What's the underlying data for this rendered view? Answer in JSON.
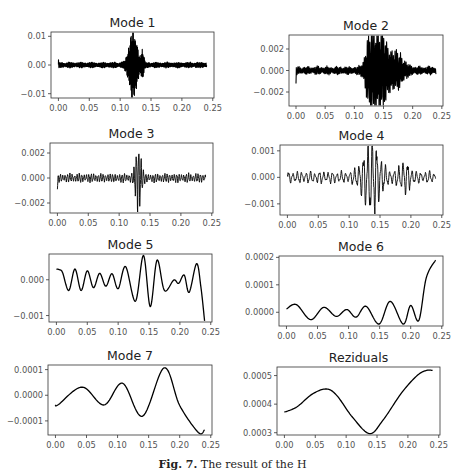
{
  "figure": {
    "caption_label": "Fig. 7.",
    "caption_text": " The result of the H",
    "colors": {
      "line": "#000000",
      "axis": "#333333",
      "tick_text": "#555555",
      "title": "#222222"
    }
  },
  "chart_data": [
    {
      "type": "line",
      "id": "mode1",
      "title": "Mode 1",
      "xlabel": "",
      "ylabel": "",
      "xlim": [
        -0.012,
        0.252
      ],
      "ylim": [
        -0.0115,
        0.0115
      ],
      "xticks": [
        0.0,
        0.05,
        0.1,
        0.15,
        0.2,
        0.25
      ],
      "xtick_labels": [
        "0.00",
        "0.05",
        "0.10",
        "0.15",
        "0.20",
        "0.25"
      ],
      "yticks": [
        0.01,
        0.0,
        -0.01
      ],
      "ytick_labels": [
        "0.01",
        "0.00",
        "−0.01"
      ],
      "grid": false,
      "signal": {
        "x_range": [
          0.0,
          0.24
        ],
        "baseline_amp": 0.0009,
        "freq": 900,
        "bursts": [
          {
            "center": 0.121,
            "width": 0.006,
            "amp": 0.0105,
            "decay": 1.0
          },
          {
            "center": 0.136,
            "width": 0.002,
            "amp": 0.004
          }
        ],
        "start_spike": 0.0018,
        "dense": true
      },
      "box": {
        "left": 51,
        "top": 32,
        "right": 214,
        "bottom": 98
      }
    },
    {
      "type": "line",
      "id": "mode2",
      "title": "Mode 2",
      "xlabel": "",
      "ylabel": "",
      "xlim": [
        -0.012,
        0.252
      ],
      "ylim": [
        -0.0033,
        0.0033
      ],
      "xticks": [
        0.0,
        0.05,
        0.1,
        0.15,
        0.2,
        0.25
      ],
      "xtick_labels": [
        "0.00",
        "0.05",
        "0.10",
        "0.15",
        "0.20",
        "0.25"
      ],
      "yticks": [
        0.002,
        0.0,
        -0.002
      ],
      "ytick_labels": [
        "0.002",
        "0.000",
        "−0.002"
      ],
      "grid": false,
      "signal": {
        "x_range": [
          0.0,
          0.24
        ],
        "baseline_amp": 0.00035,
        "freq": 420,
        "bursts": [
          {
            "center": 0.128,
            "width": 0.007,
            "amp": 0.0031
          },
          {
            "center": 0.146,
            "width": 0.008,
            "amp": 0.0031
          },
          {
            "center": 0.17,
            "width": 0.012,
            "amp": 0.0014
          }
        ],
        "start_value": -0.0012,
        "dense": true
      },
      "box": {
        "left": 289,
        "top": 35,
        "right": 443,
        "bottom": 106
      }
    },
    {
      "type": "line",
      "id": "mode3",
      "title": "Mode 3",
      "xlabel": "",
      "ylabel": "",
      "xlim": [
        -0.012,
        0.252
      ],
      "ylim": [
        -0.0028,
        0.0028
      ],
      "xticks": [
        0.0,
        0.05,
        0.1,
        0.15,
        0.2,
        0.25
      ],
      "xtick_labels": [
        "0.00",
        "0.05",
        "0.10",
        "0.15",
        "0.20",
        "0.25"
      ],
      "yticks": [
        0.002,
        0.0,
        -0.002
      ],
      "ytick_labels": [
        "0.002",
        "0.000",
        "−0.002"
      ],
      "grid": false,
      "signal": {
        "x_range": [
          0.0,
          0.24
        ],
        "baseline_amp": 0.00035,
        "freq": 260,
        "bursts": [
          {
            "center": 0.131,
            "width": 0.004,
            "amp": 0.0026
          }
        ],
        "start_value": -0.0009,
        "dense": false
      },
      "box": {
        "left": 50,
        "top": 143,
        "right": 213,
        "bottom": 213
      }
    },
    {
      "type": "line",
      "id": "mode4",
      "title": "Mode 4",
      "xlabel": "",
      "ylabel": "",
      "xlim": [
        -0.012,
        0.252
      ],
      "ylim": [
        -0.00142,
        0.00122
      ],
      "xticks": [
        0.0,
        0.05,
        0.1,
        0.15,
        0.2,
        0.25
      ],
      "xtick_labels": [
        "0.00",
        "0.05",
        "0.10",
        "0.15",
        "0.20",
        "0.25"
      ],
      "yticks": [
        0.001,
        0.0,
        -0.001
      ],
      "ytick_labels": [
        "0.001",
        "0.000",
        "−0.001"
      ],
      "grid": false,
      "signal": {
        "x_range": [
          0.0,
          0.24
        ],
        "baseline_amp": 0.00022,
        "freq": 140,
        "bursts": [
          {
            "center": 0.136,
            "width": 0.012,
            "amp": 0.00125
          },
          {
            "center": 0.19,
            "width": 0.008,
            "amp": 0.0004
          }
        ],
        "start_value": 0.0001,
        "dense": false
      },
      "box": {
        "left": 280,
        "top": 145,
        "right": 443,
        "bottom": 215
      }
    },
    {
      "type": "line",
      "id": "mode5",
      "title": "Mode 5",
      "xlabel": "",
      "ylabel": "",
      "xlim": [
        -0.012,
        0.252
      ],
      "ylim": [
        -0.00118,
        0.00072
      ],
      "xticks": [
        0.0,
        0.05,
        0.1,
        0.15,
        0.2,
        0.25
      ],
      "xtick_labels": [
        "0.00",
        "0.05",
        "0.10",
        "0.15",
        "0.20",
        "0.25"
      ],
      "yticks": [
        0.0,
        -0.001
      ],
      "ytick_labels": [
        "0.000",
        "−0.001"
      ],
      "grid": false,
      "points": [
        [
          0.0,
          0.0003
        ],
        [
          0.005,
          0.00028
        ],
        [
          0.01,
          0.0002
        ],
        [
          0.02,
          -0.0003
        ],
        [
          0.03,
          0.0003
        ],
        [
          0.04,
          -0.0003
        ],
        [
          0.05,
          0.00025
        ],
        [
          0.06,
          -0.00022
        ],
        [
          0.07,
          0.00018
        ],
        [
          0.08,
          -0.00018
        ],
        [
          0.09,
          0.00017
        ],
        [
          0.1,
          -0.00025
        ],
        [
          0.112,
          0.00037
        ],
        [
          0.128,
          -0.0006
        ],
        [
          0.141,
          0.00068
        ],
        [
          0.152,
          -0.00075
        ],
        [
          0.163,
          0.00055
        ],
        [
          0.175,
          -0.0003
        ],
        [
          0.19,
          -1e-05
        ],
        [
          0.198,
          -0.0001
        ],
        [
          0.207,
          0.00013
        ],
        [
          0.215,
          -0.00035
        ],
        [
          0.227,
          0.00045
        ],
        [
          0.234,
          -0.0002
        ],
        [
          0.24,
          -0.00115
        ]
      ],
      "box": {
        "left": 49,
        "top": 254,
        "right": 212,
        "bottom": 322
      }
    },
    {
      "type": "line",
      "id": "mode6",
      "title": "Mode 6",
      "xlabel": "",
      "ylabel": "",
      "xlim": [
        -0.012,
        0.252
      ],
      "ylim": [
        -5e-05,
        0.000205
      ],
      "xticks": [
        0.0,
        0.05,
        0.1,
        0.15,
        0.2,
        0.25
      ],
      "xtick_labels": [
        "0.00",
        "0.05",
        "0.10",
        "0.15",
        "0.20",
        "0.25"
      ],
      "yticks": [
        0.0002,
        0.0001,
        0.0
      ],
      "ytick_labels": [
        "0.0002",
        "0.0001",
        "0.0000"
      ],
      "grid": false,
      "points": [
        [
          0.0,
          1.2e-05
        ],
        [
          0.016,
          2.8e-05
        ],
        [
          0.039,
          -2.7e-05
        ],
        [
          0.06,
          1.8e-05
        ],
        [
          0.08,
          -1.5e-05
        ],
        [
          0.097,
          1e-05
        ],
        [
          0.112,
          -1.8e-05
        ],
        [
          0.128,
          2.2e-05
        ],
        [
          0.149,
          -4.3e-05
        ],
        [
          0.167,
          4e-05
        ],
        [
          0.188,
          -4.3e-05
        ],
        [
          0.2,
          2.5e-05
        ],
        [
          0.213,
          -3e-05
        ],
        [
          0.225,
          0.000125
        ],
        [
          0.24,
          0.00019
        ]
      ],
      "box": {
        "left": 279,
        "top": 256,
        "right": 443,
        "bottom": 326
      }
    },
    {
      "type": "line",
      "id": "mode7",
      "title": "Mode 7",
      "xlabel": "",
      "ylabel": "",
      "xlim": [
        -0.012,
        0.252
      ],
      "ylim": [
        -0.000155,
        0.000118
      ],
      "xticks": [
        0.0,
        0.05,
        0.1,
        0.15,
        0.2,
        0.25
      ],
      "xtick_labels": [
        "0.00",
        "0.05",
        "0.10",
        "0.15",
        "0.20",
        "0.25"
      ],
      "yticks": [
        0.0001,
        0.0,
        -0.0001
      ],
      "ytick_labels": [
        "0.0001",
        "0.0000",
        "−0.0001"
      ],
      "grid": false,
      "points": [
        [
          0.0,
          -3.8e-05
        ],
        [
          0.005,
          -3.6e-05
        ],
        [
          0.043,
          3.2e-05
        ],
        [
          0.078,
          -3.8e-05
        ],
        [
          0.108,
          4.7e-05
        ],
        [
          0.14,
          -8.2e-05
        ],
        [
          0.175,
          0.000107
        ],
        [
          0.2,
          -4e-05
        ],
        [
          0.23,
          -0.000145
        ],
        [
          0.24,
          -0.000135
        ]
      ],
      "box": {
        "left": 48,
        "top": 365,
        "right": 212,
        "bottom": 435
      }
    },
    {
      "type": "line",
      "id": "reziduals",
      "title": "Reziduals",
      "xlabel": "",
      "ylabel": "",
      "xlim": [
        -0.012,
        0.252
      ],
      "ylim": [
        0.000292,
        0.00053
      ],
      "xticks": [
        0.0,
        0.05,
        0.1,
        0.15,
        0.2,
        0.25
      ],
      "xtick_labels": [
        "0.00",
        "0.05",
        "0.10",
        "0.15",
        "0.20",
        "0.25"
      ],
      "yticks": [
        0.0005,
        0.0004,
        0.0003
      ],
      "ytick_labels": [
        "0.0005",
        "0.0004",
        "0.0003"
      ],
      "grid": false,
      "points": [
        [
          0.0,
          0.000372
        ],
        [
          0.02,
          0.00039
        ],
        [
          0.045,
          0.000435
        ],
        [
          0.068,
          0.000453
        ],
        [
          0.085,
          0.00043
        ],
        [
          0.11,
          0.000355
        ],
        [
          0.138,
          0.000297
        ],
        [
          0.16,
          0.000345
        ],
        [
          0.19,
          0.00044
        ],
        [
          0.215,
          0.0005
        ],
        [
          0.23,
          0.000518
        ],
        [
          0.24,
          0.000518
        ]
      ],
      "box": {
        "left": 277,
        "top": 367,
        "right": 440,
        "bottom": 435
      }
    }
  ]
}
